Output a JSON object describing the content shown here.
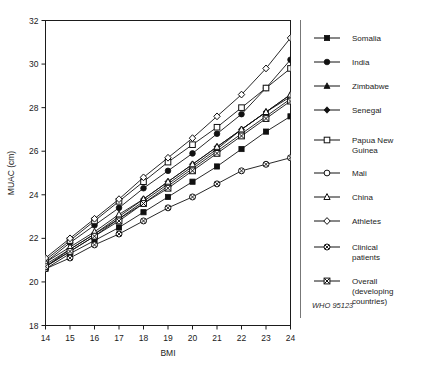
{
  "figure": {
    "cut_off_title": "",
    "source_note": "WHO 95123"
  },
  "axis": {
    "x_label": "BMI",
    "y_label": "MUAC (cm)",
    "x_ticks": [
      "14",
      "15",
      "16",
      "17",
      "18",
      "19",
      "20",
      "21",
      "22",
      "23",
      "24"
    ],
    "y_ticks": [
      "18",
      "20",
      "22",
      "24",
      "26",
      "28",
      "30",
      "32"
    ]
  },
  "legend": {
    "items": [
      {
        "label": "Somalia",
        "marker": "filled-square"
      },
      {
        "label": "India",
        "marker": "filled-circle"
      },
      {
        "label": "Zimbabwe",
        "marker": "filled-triangle"
      },
      {
        "label": "Senegal",
        "marker": "filled-diamond"
      },
      {
        "label": "Papua New Guinea",
        "marker": "open-square"
      },
      {
        "label": "Mali",
        "marker": "open-circle"
      },
      {
        "label": "China",
        "marker": "open-triangle"
      },
      {
        "label": "Athletes",
        "marker": "open-diamond"
      },
      {
        "label": "Clinical patients",
        "marker": "crossed-circle"
      },
      {
        "label": "Overall (developing countries)",
        "marker": "crossed-square"
      }
    ]
  },
  "chart_data": {
    "type": "line",
    "title": "",
    "xlabel": "BMI",
    "ylabel": "MUAC (cm)",
    "xlim": [
      14,
      24
    ],
    "ylim": [
      18,
      32
    ],
    "grid": false,
    "legend_position": "right",
    "x": [
      14,
      15,
      16,
      17,
      18,
      19,
      20,
      21,
      22,
      23,
      24
    ],
    "series": [
      {
        "name": "Somalia",
        "marker": "filled-square",
        "values": [
          20.6,
          21.3,
          21.9,
          22.5,
          23.2,
          23.9,
          24.6,
          25.3,
          26.1,
          26.9,
          27.6
        ]
      },
      {
        "name": "India",
        "marker": "filled-circle",
        "values": [
          20.9,
          21.8,
          22.6,
          23.4,
          24.3,
          25.1,
          25.9,
          26.8,
          27.7,
          28.9,
          30.2
        ]
      },
      {
        "name": "Zimbabwe",
        "marker": "filled-triangle",
        "values": [
          20.7,
          21.5,
          22.2,
          22.9,
          23.7,
          24.5,
          25.3,
          26.1,
          27.0,
          27.8,
          28.6
        ]
      },
      {
        "name": "Senegal",
        "marker": "filled-diamond",
        "values": [
          20.8,
          21.5,
          22.2,
          23.0,
          23.8,
          24.6,
          25.4,
          26.2,
          27.0,
          27.8,
          28.5
        ]
      },
      {
        "name": "Papua New Guinea",
        "marker": "open-square",
        "values": [
          21.0,
          21.9,
          22.8,
          23.7,
          24.6,
          25.5,
          26.3,
          27.1,
          28.0,
          28.9,
          29.8
        ]
      },
      {
        "name": "Mali",
        "marker": "open-circle",
        "values": [
          20.7,
          21.4,
          22.1,
          22.9,
          23.6,
          24.4,
          25.2,
          26.0,
          26.8,
          27.6,
          28.4
        ]
      },
      {
        "name": "China",
        "marker": "open-triangle",
        "values": [
          20.9,
          21.6,
          22.3,
          23.1,
          23.8,
          24.6,
          25.4,
          26.2,
          27.0,
          27.8,
          28.6
        ]
      },
      {
        "name": "Athletes",
        "marker": "open-diamond",
        "values": [
          21.1,
          22.0,
          22.9,
          23.8,
          24.8,
          25.7,
          26.6,
          27.6,
          28.6,
          29.8,
          31.2
        ]
      },
      {
        "name": "Clinical patients",
        "marker": "crossed-circle",
        "values": [
          20.6,
          21.1,
          21.7,
          22.2,
          22.8,
          23.4,
          23.9,
          24.5,
          25.1,
          25.4,
          25.7
        ]
      },
      {
        "name": "Overall (developing countries)",
        "marker": "crossed-square",
        "values": [
          20.7,
          21.4,
          22.1,
          22.8,
          23.6,
          24.3,
          25.1,
          25.9,
          26.7,
          27.5,
          28.3
        ]
      }
    ]
  }
}
